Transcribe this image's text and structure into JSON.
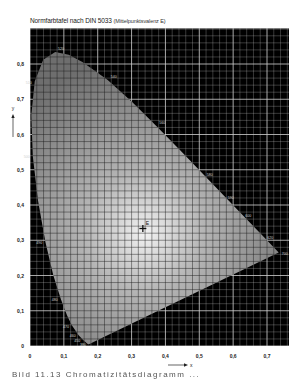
{
  "title": {
    "main": "Normfarbtafel nach DIN 5033",
    "sub": "(Mittelpunktsvalenz E)"
  },
  "caption": "Bild 11.13  Chromatizitätsdiagramm ...",
  "chart_data": {
    "type": "scatter",
    "title": "Normfarbtafel nach DIN 5033 (Mittelpunktsvalenz E)",
    "xlabel": "x",
    "ylabel": "y",
    "xlim": [
      0,
      0.76
    ],
    "ylim": [
      0,
      0.9
    ],
    "grid": true,
    "x_ticks": [
      "0",
      "0,1",
      "0,2",
      "0,3",
      "0,4",
      "0,5",
      "0,6",
      "0,7"
    ],
    "y_ticks": [
      "0",
      "0,1",
      "0,2",
      "0,3",
      "0,4",
      "0,5",
      "0,6",
      "0,7",
      "0,8"
    ],
    "spectral_locus": [
      {
        "nm": 380,
        "x": 0.1741,
        "y": 0.005
      },
      {
        "nm": 420,
        "x": 0.1714,
        "y": 0.0051
      },
      {
        "nm": 440,
        "x": 0.1644,
        "y": 0.0109
      },
      {
        "nm": 450,
        "x": 0.1566,
        "y": 0.0177
      },
      {
        "nm": 460,
        "x": 0.144,
        "y": 0.0297
      },
      {
        "nm": 470,
        "x": 0.1241,
        "y": 0.0578
      },
      {
        "nm": 475,
        "x": 0.1096,
        "y": 0.0868
      },
      {
        "nm": 480,
        "x": 0.0913,
        "y": 0.1327
      },
      {
        "nm": 485,
        "x": 0.0687,
        "y": 0.2007
      },
      {
        "nm": 490,
        "x": 0.0454,
        "y": 0.295
      },
      {
        "nm": 495,
        "x": 0.0235,
        "y": 0.4127
      },
      {
        "nm": 500,
        "x": 0.0082,
        "y": 0.5384
      },
      {
        "nm": 505,
        "x": 0.0039,
        "y": 0.6548
      },
      {
        "nm": 510,
        "x": 0.0139,
        "y": 0.7502
      },
      {
        "nm": 515,
        "x": 0.0389,
        "y": 0.812
      },
      {
        "nm": 520,
        "x": 0.0743,
        "y": 0.8338
      },
      {
        "nm": 525,
        "x": 0.1142,
        "y": 0.8262
      },
      {
        "nm": 530,
        "x": 0.1547,
        "y": 0.8059
      },
      {
        "nm": 540,
        "x": 0.2296,
        "y": 0.7543
      },
      {
        "nm": 550,
        "x": 0.3016,
        "y": 0.6923
      },
      {
        "nm": 560,
        "x": 0.3731,
        "y": 0.6245
      },
      {
        "nm": 570,
        "x": 0.4441,
        "y": 0.5547
      },
      {
        "nm": 580,
        "x": 0.5125,
        "y": 0.4866
      },
      {
        "nm": 590,
        "x": 0.5752,
        "y": 0.4242
      },
      {
        "nm": 600,
        "x": 0.627,
        "y": 0.3725
      },
      {
        "nm": 610,
        "x": 0.6658,
        "y": 0.334
      },
      {
        "nm": 620,
        "x": 0.6915,
        "y": 0.3083
      },
      {
        "nm": 640,
        "x": 0.719,
        "y": 0.2809
      },
      {
        "nm": 700,
        "x": 0.7347,
        "y": 0.2653
      }
    ],
    "locus_labels": [
      {
        "text": "520",
        "x": 0.074,
        "y": 0.834
      },
      {
        "text": "540",
        "x": 0.23,
        "y": 0.754
      },
      {
        "text": "510",
        "x": 0.014,
        "y": 0.75
      },
      {
        "text": "500",
        "x": 0.008,
        "y": 0.538
      },
      {
        "text": "490",
        "x": 0.045,
        "y": 0.295
      },
      {
        "text": "480",
        "x": 0.091,
        "y": 0.133
      },
      {
        "text": "470",
        "x": 0.124,
        "y": 0.058
      },
      {
        "text": "460",
        "x": 0.144,
        "y": 0.03
      },
      {
        "text": "450",
        "x": 0.157,
        "y": 0.018
      },
      {
        "text": "380",
        "x": 0.174,
        "y": 0.005
      },
      {
        "text": "560",
        "x": 0.373,
        "y": 0.625
      },
      {
        "text": "580",
        "x": 0.513,
        "y": 0.487
      },
      {
        "text": "590",
        "x": 0.575,
        "y": 0.424
      },
      {
        "text": "600",
        "x": 0.627,
        "y": 0.373
      },
      {
        "text": "620",
        "x": 0.692,
        "y": 0.308
      },
      {
        "text": "700",
        "x": 0.735,
        "y": 0.265
      }
    ],
    "white_point": {
      "label": "E",
      "x": 0.3333,
      "y": 0.3333
    },
    "colors": {
      "background": "#000000",
      "grid_outside": "#cfcfcf",
      "grid_inside": "#1a1a1a",
      "locus_fill_center": "#f2f2f2",
      "locus_fill_edge": "#6e6e6e"
    }
  }
}
